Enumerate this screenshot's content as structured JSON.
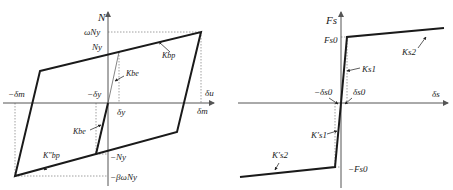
{
  "left_plot": {
    "axis_labels": {
      "y": "N",
      "x": "δm"
    },
    "y_labels": {
      "omega_ny": "ωNy",
      "ny": "Ny",
      "neg_ny": "−Ny",
      "neg_beta": "−βωNy"
    },
    "x_labels": {
      "neg_dm": "−δm",
      "neg_dy": "−δy",
      "dy": "δy",
      "du": "δu",
      "dm": "δm"
    },
    "stiffness_labels": {
      "kbp": "Kbp",
      "kbe_top": "Kbe",
      "kbe_bottom": "Kbe",
      "kbp_prime": "K″bp"
    },
    "colors": {
      "curve": "#1a1a1a",
      "axis": "#555555",
      "guide": "#888888"
    }
  },
  "right_plot": {
    "axis_labels": {
      "y": "Fs",
      "x": "δs"
    },
    "y_labels": {
      "fs0": "Fs0",
      "neg_fs0": "−Fs0"
    },
    "x_labels": {
      "neg_ds0": "−δs0",
      "ds0": "δs0"
    },
    "stiffness_labels": {
      "ks1": "Ks1",
      "ks2": "Ks2",
      "ks1_prime": "K′s1",
      "ks2_prime": "K′s2"
    },
    "colors": {
      "curve": "#1a1a1a",
      "axis": "#555555",
      "guide": "#888888"
    }
  }
}
